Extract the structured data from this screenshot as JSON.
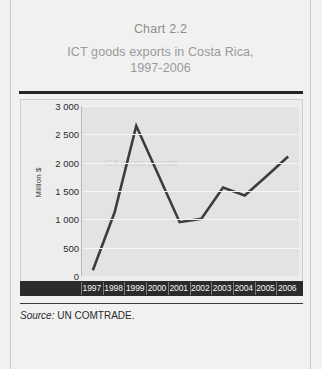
{
  "figure": {
    "number": "Chart 2.2",
    "title": "ICT goods exports in Costa Rica,\n1997-2006",
    "title_line1": "ICT goods exports in Costa Rica,",
    "title_line2": "1997-2006"
  },
  "source": {
    "label": "Source:",
    "text": "UN COMTRADE."
  },
  "colors": {
    "line": "#3d3d3d",
    "plot_background": "#e3e3e3",
    "gridline": "#f6f6f6",
    "axis_band": "#2b2b2b",
    "title_text": "#9a9a9a",
    "rule": "#262626",
    "page_background": "#f1f1f1"
  },
  "chart_data": {
    "type": "line",
    "title": "ICT goods exports in Costa Rica, 1997-2006",
    "xlabel": "",
    "ylabel": "Million $",
    "categories": [
      "1997",
      "1998",
      "1999",
      "2000",
      "2001",
      "2002",
      "2003",
      "2004",
      "2005",
      "2006"
    ],
    "x": [
      1997,
      1998,
      1999,
      2000,
      2001,
      2002,
      2003,
      2004,
      2005,
      2006
    ],
    "values": [
      100,
      1120,
      2650,
      1800,
      950,
      1010,
      1560,
      1420,
      1760,
      2110
    ],
    "series": [
      {
        "name": "ICT goods exports",
        "values": [
          100,
          1120,
          2650,
          1800,
          950,
          1010,
          1560,
          1420,
          1760,
          2110
        ]
      }
    ],
    "ylim": [
      0,
      3000
    ],
    "yticks": [
      0,
      500,
      1000,
      1500,
      2000,
      2500,
      3000
    ],
    "ytick_labels": [
      "0",
      "500",
      "1 000",
      "1 500",
      "2 000",
      "2 500",
      "3 000"
    ],
    "grid": true,
    "legend": false,
    "legend_position": "none"
  }
}
